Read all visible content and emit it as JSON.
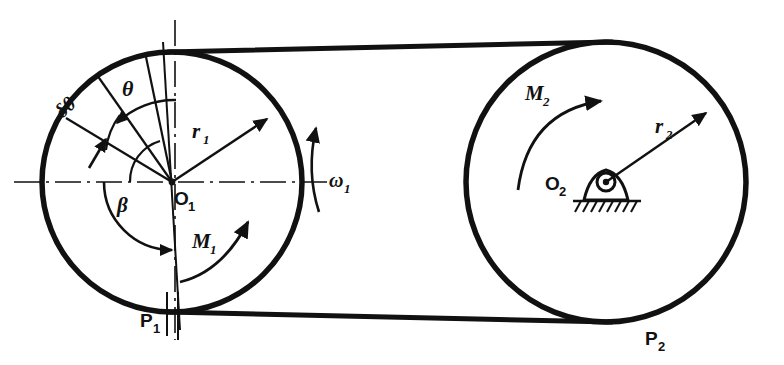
{
  "figure": {
    "type": "engineering-diagram",
    "background_color": "#ffffff",
    "line_color": "#111111"
  },
  "labels": {
    "theta": "θ",
    "delta_theta": "δθ",
    "beta": "β",
    "r1": "r",
    "r1_sub": "1",
    "r2": "r",
    "r2_sub": "2",
    "omega1": "ω",
    "omega1_sub": "1",
    "M1": "M",
    "M1_sub": "1",
    "M2": "M",
    "M2_sub": "2",
    "O1": "O",
    "O1_sub": "1",
    "O2": "O",
    "O2_sub": "2",
    "P1": "P",
    "P1_sub": "1",
    "P2": "P",
    "P2_sub": "2"
  },
  "geometry": {
    "pulley1": {
      "cx": 172,
      "cy": 182,
      "r": 130,
      "inner_r": 42
    },
    "pulley2": {
      "cx": 606,
      "cy": 182,
      "r": 140
    },
    "belt": {
      "top_tangent": "from small pulley top to large pulley top",
      "bottom_tangent": "from small pulley bottom to large pulley bottom"
    },
    "contact_points": {
      "P1": "bottom of small pulley",
      "P2": "bottom of large pulley"
    },
    "support": {
      "type": "pinned-bearing-with-ground-hatching",
      "at": "O2"
    }
  },
  "annotations": {
    "theta_description": "angle from vertical reference to radial line",
    "delta_theta_description": "incremental angle increment",
    "beta_description": "wrap angle arc measured at O1",
    "omega1_description": "angular velocity of driving pulley, counterclockwise arrow",
    "M1_description": "torque on small pulley",
    "M2_description": "torque on large pulley"
  }
}
